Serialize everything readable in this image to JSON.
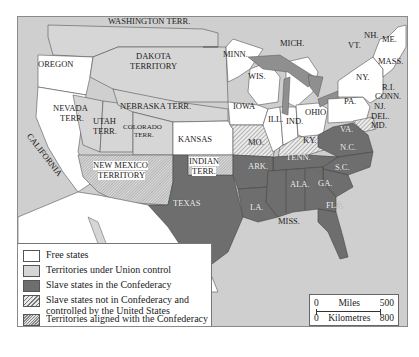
{
  "map": {
    "title": "United States during the Civil War",
    "colors": {
      "free": "#ffffff",
      "union_territory": "#d6d6d6",
      "confederacy": "#6e6e6e",
      "border_slave": "#e8e8e8",
      "water": "#cfcfcf"
    },
    "labels": {
      "washington": "WASHINGTON TERR.",
      "oregon": "OREGON",
      "california": "CALIFORNIA",
      "nevada": "NEVADA",
      "nevada2": "TERR.",
      "utah": "UTAH",
      "utah2": "TERR.",
      "colorado": "COLORADO",
      "colorado2": "TERR.",
      "dakota": "DAKOTA",
      "dakota2": "TERRITORY",
      "nebraska": "NEBRASKA TERR.",
      "kansas": "KANSAS",
      "new_mexico": "NEW MEXICO",
      "new_mexico2": "TERRITORY",
      "indian": "INDIAN",
      "indian2": "TERR.",
      "texas": "TEXAS",
      "minn": "MINN.",
      "wis": "WIS.",
      "iowa": "IOWA",
      "ill": "ILL.",
      "ind": "IND.",
      "ohio": "OHIO",
      "mich": "MICH.",
      "mo": "MO.",
      "ky": "KY.",
      "ark": "ARK.",
      "tenn": "TENN.",
      "la": "LA.",
      "miss": "MISS.",
      "ala": "ALA.",
      "ga": "GA.",
      "fla": "FLA.",
      "sc": "S.C.",
      "nc": "N.C.",
      "va": "VA.",
      "pa": "PA.",
      "ny": "NY.",
      "vt": "VT.",
      "nh": "NH.",
      "me": "ME.",
      "mass": "MASS.",
      "ri": "R.I.",
      "conn": "CONN.",
      "nj": "NJ.",
      "del": "DEL.",
      "md": "MD."
    }
  },
  "legend": {
    "items": [
      {
        "label": "Free states"
      },
      {
        "label": "Territories under Union control"
      },
      {
        "label": "Slave states in the Confederacy"
      },
      {
        "label": "Slave states not in Confederacy and controlled by the United States"
      },
      {
        "label": "Territories aligned with the Confederacy"
      }
    ]
  },
  "scale": {
    "miles_start": "0",
    "miles_label": "Miles",
    "miles_end": "500",
    "km_start": "0",
    "km_label": "Kilometres",
    "km_end": "800"
  }
}
